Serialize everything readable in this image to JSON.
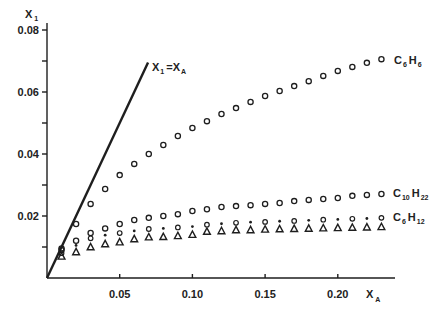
{
  "chart_data": {
    "type": "scatter",
    "title": "",
    "xlabel": "X",
    "xlabel_subscript": "A",
    "ylabel": "X",
    "ylabel_subscript": "1",
    "xlim": [
      0,
      0.24
    ],
    "ylim": [
      0,
      0.085
    ],
    "x_ticks": [
      0.05,
      0.1,
      0.15,
      0.2
    ],
    "x_tick_labels": [
      "0.05",
      "0.10",
      "0.15",
      "0.20"
    ],
    "y_ticks_major": [
      0.02,
      0.04,
      0.06,
      0.08
    ],
    "y_tick_labels": [
      "0.02",
      "0.04",
      "0.06",
      "0.08"
    ],
    "y_ticks_minor": [
      0.01,
      0.03,
      0.05,
      0.07
    ],
    "grid": false,
    "reference_line": {
      "label": "X1=XA",
      "label_main_1": "X",
      "label_sub_1": "1",
      "label_eq": "=",
      "label_main_2": "X",
      "label_sub_2": "A",
      "x": [
        0,
        0.0695
      ],
      "y": [
        0,
        0.0695
      ]
    },
    "series": [
      {
        "name": "C6H6",
        "label_parts": [
          "C",
          "6",
          "H",
          "6"
        ],
        "marker": "open-circle",
        "x": [
          0.01,
          0.02,
          0.03,
          0.04,
          0.05,
          0.06,
          0.07,
          0.08,
          0.09,
          0.1,
          0.11,
          0.12,
          0.13,
          0.14,
          0.15,
          0.16,
          0.17,
          0.18,
          0.19,
          0.2,
          0.21,
          0.22,
          0.23
        ],
        "y": [
          0.0095,
          0.0174,
          0.0239,
          0.0287,
          0.0332,
          0.0368,
          0.04,
          0.0429,
          0.0458,
          0.0484,
          0.0506,
          0.0529,
          0.0548,
          0.0568,
          0.0587,
          0.0603,
          0.0619,
          0.0635,
          0.0652,
          0.0668,
          0.0681,
          0.0694,
          0.0706
        ]
      },
      {
        "name": "C10H22",
        "label_parts": [
          "C",
          "10",
          "H",
          "22"
        ],
        "marker": "open-circle",
        "x": [
          0.01,
          0.02,
          0.03,
          0.04,
          0.05,
          0.06,
          0.07,
          0.08,
          0.09,
          0.1,
          0.11,
          0.12,
          0.13,
          0.14,
          0.15,
          0.16,
          0.17,
          0.18,
          0.19,
          0.2,
          0.21,
          0.22,
          0.23
        ],
        "y": [
          0.009,
          0.012,
          0.0145,
          0.016,
          0.0174,
          0.0187,
          0.0194,
          0.02,
          0.0206,
          0.0216,
          0.0222,
          0.0229,
          0.0232,
          0.0235,
          0.0239,
          0.0242,
          0.0248,
          0.0252,
          0.0255,
          0.0258,
          0.0265,
          0.0268,
          0.0271
        ]
      },
      {
        "name": "C6H12 (upper markers)",
        "marker": "alternating-circle-asterisk",
        "x": [
          0.01,
          0.02,
          0.03,
          0.04,
          0.05,
          0.06,
          0.07,
          0.08,
          0.09,
          0.1,
          0.11,
          0.12,
          0.13,
          0.14,
          0.15,
          0.16,
          0.17,
          0.18,
          0.19,
          0.2,
          0.21,
          0.22,
          0.23
        ],
        "y": [
          0.008,
          0.0105,
          0.0128,
          0.0138,
          0.0145,
          0.0152,
          0.0158,
          0.016,
          0.0163,
          0.0166,
          0.0172,
          0.0175,
          0.0178,
          0.018,
          0.0181,
          0.0183,
          0.0184,
          0.0186,
          0.0188,
          0.0189,
          0.0191,
          0.0192,
          0.0194
        ]
      },
      {
        "name": "C6H12",
        "label_parts": [
          "C",
          "6",
          "H",
          "12"
        ],
        "marker": "open-triangle",
        "x": [
          0.01,
          0.02,
          0.03,
          0.04,
          0.05,
          0.06,
          0.07,
          0.08,
          0.09,
          0.1,
          0.11,
          0.12,
          0.13,
          0.14,
          0.15,
          0.16,
          0.17,
          0.18,
          0.19,
          0.2,
          0.21,
          0.22,
          0.23
        ],
        "y": [
          0.007,
          0.0084,
          0.01,
          0.011,
          0.0116,
          0.0126,
          0.0132,
          0.0133,
          0.0136,
          0.014,
          0.015,
          0.0152,
          0.0155,
          0.0155,
          0.0157,
          0.0158,
          0.0159,
          0.016,
          0.0161,
          0.0162,
          0.0163,
          0.0164,
          0.0165
        ]
      }
    ],
    "annotations": [
      "X1=XA",
      "C6H6",
      "C10H22",
      "C6H12"
    ]
  }
}
